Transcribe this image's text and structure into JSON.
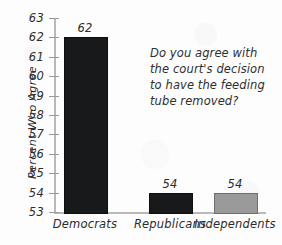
{
  "chart_data": {
    "type": "bar",
    "title": "",
    "subtitle": "",
    "xlabel": "",
    "ylabel": "Percent Who Agree",
    "ylim": [
      53,
      63
    ],
    "grid": false,
    "legend": "none",
    "categories": [
      "Democrats",
      "Republicans",
      "Independents"
    ],
    "values": [
      62,
      54,
      54
    ],
    "value_labels": [
      "62",
      "54",
      "54"
    ],
    "bar_colors": [
      "#17191a",
      "#17191a",
      "#9a9a9a"
    ],
    "y_ticks": [
      63,
      62,
      61,
      60,
      59,
      58,
      57,
      56,
      55,
      54,
      53
    ],
    "y_tick_labels": [
      "63",
      "62",
      "61",
      "60",
      "59",
      "58",
      "57",
      "56",
      "55",
      "54",
      "53"
    ],
    "annotations": [
      {
        "name": "survey-question",
        "text": "Do you agree with the court's decision to have the feeding tube removed?"
      }
    ]
  },
  "axes": {
    "y_title": "Percent Who Agree",
    "axis_color": "#b9b9b9",
    "tick_color": "#9a9a9a",
    "text_color": "#2e2e2e"
  },
  "annotation": {
    "line1": "Do you agree with",
    "line2": "the court's decision",
    "line3": "to have the feeding",
    "line4": "tube removed?"
  }
}
